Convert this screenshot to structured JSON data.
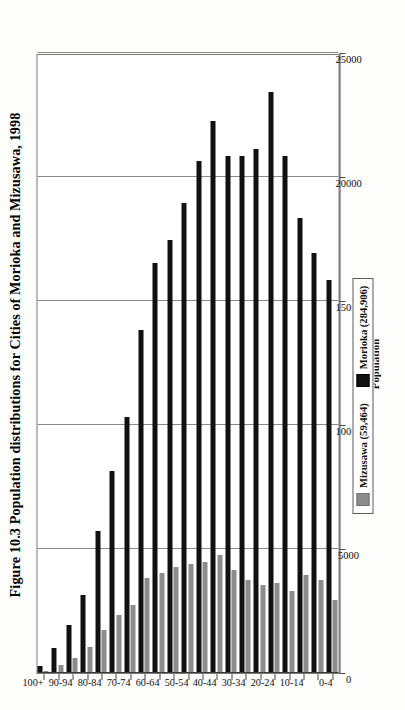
{
  "figure": {
    "title": "Figure 10.3 Population distributions for Cities of Morioka and Mizusawa, 1998",
    "rotation": "90-degrees-counterclockwise"
  },
  "legend": {
    "position": "bottom-center",
    "entries": [
      {
        "label": "Mizusawa (59,464)",
        "color": "#8c8c8c",
        "swatch": "gray-square"
      },
      {
        "label": "Morioka (284,906)",
        "color": "#111111",
        "swatch": "black-square"
      }
    ]
  },
  "axes": {
    "value_axis_title": "Population",
    "value_ticks": [
      "0",
      "5000",
      "10000",
      "15000",
      "20000",
      "25000"
    ],
    "category_ticks": [
      "0-4",
      "5-9",
      "10-14",
      "15-19",
      "20-24",
      "25-29",
      "30-34",
      "35-39",
      "40-44",
      "45-49",
      "50-54",
      "55-59",
      "60-64",
      "65-69",
      "70-74",
      "75-79",
      "80-84",
      "85-89",
      "90-94",
      "95-99",
      "100+"
    ],
    "category_labels_shown": [
      "100+",
      "90-94",
      "80-84",
      "70-74",
      "60-64",
      "50-54",
      "40-44",
      "30-34",
      "20-24",
      "10-14",
      "0-4"
    ]
  },
  "chart_data": {
    "type": "bar",
    "title": "Figure 10.3 Population distributions for Cities of Morioka and Mizusawa, 1998",
    "xlabel": "Age group",
    "ylabel": "Population",
    "ylim": [
      0,
      25000
    ],
    "grid": true,
    "orientation": "vertical-bars-rotated",
    "legend_position": "bottom-center",
    "categories": [
      "100+",
      "95-99",
      "90-94",
      "85-89",
      "80-84",
      "75-79",
      "70-74",
      "65-69",
      "60-64",
      "55-59",
      "50-54",
      "45-49",
      "40-44",
      "35-39",
      "30-34",
      "25-29",
      "20-24",
      "15-19",
      "10-14",
      "5-9",
      "0-4"
    ],
    "series": [
      {
        "name": "Morioka (284,906)",
        "color": "#111111",
        "values": [
          230,
          950,
          1900,
          3100,
          5700,
          8100,
          10300,
          13800,
          16500,
          17400,
          18900,
          20600,
          22200,
          20800,
          20800,
          21100,
          23400,
          20800,
          18300,
          16900,
          15800
        ]
      },
      {
        "name": "Mizusawa (59,464)",
        "color": "#8c8c8c",
        "values": [
          60,
          290,
          560,
          1000,
          1700,
          2300,
          2700,
          3800,
          4000,
          4250,
          4350,
          4450,
          4700,
          4100,
          3700,
          3500,
          3600,
          3250,
          3900,
          3700,
          2900
        ]
      }
    ]
  }
}
